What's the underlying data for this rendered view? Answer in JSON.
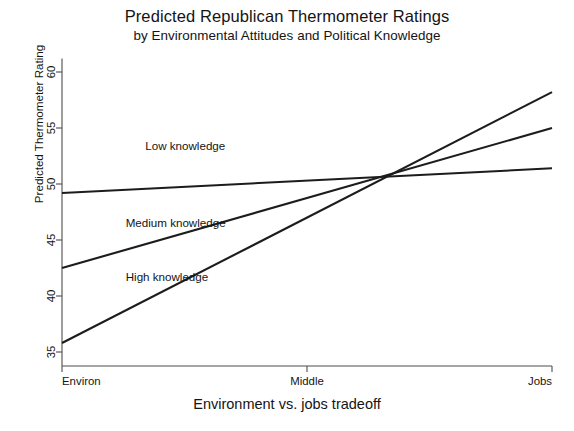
{
  "chart_data": {
    "type": "line",
    "title": "Predicted Republican Thermometer Ratings",
    "subtitle": "by Environmental Attitudes and Political Knowledge",
    "xlabel": "Environment vs. jobs tradeoff",
    "ylabel": "Predicted Thermometer Rating",
    "x_tick_labels": [
      "Environ",
      "Middle",
      "Jobs"
    ],
    "x_tick_values": [
      0,
      0.5,
      1
    ],
    "xlim": [
      0,
      1
    ],
    "y_tick_labels": [
      "35",
      "40",
      "45",
      "50",
      "55",
      "60"
    ],
    "y_tick_values": [
      35,
      40,
      45,
      50,
      55,
      60
    ],
    "ylim": [
      33.5,
      61.2
    ],
    "grid": false,
    "legend": "inline-labels",
    "x": [
      0,
      1
    ],
    "series": [
      {
        "name": "Low knowledge",
        "label": "Low knowledge",
        "values": [
          49.2,
          51.4
        ],
        "label_x": 0.17,
        "label_y": 53.0
      },
      {
        "name": "Medium knowledge",
        "label": "Medium knowledge",
        "values": [
          42.5,
          55.0
        ],
        "label_x": 0.13,
        "label_y": 46.2
      },
      {
        "name": "High knowledge",
        "label": "High knowledge",
        "values": [
          35.8,
          58.2
        ],
        "label_x": 0.13,
        "label_y": 41.3
      }
    ],
    "convergence_point": {
      "x": 0.68,
      "y": 51.1
    },
    "line_color": "#1c1c1c",
    "axis_color": "#4d4d4d",
    "background_color": "#ffffff"
  }
}
